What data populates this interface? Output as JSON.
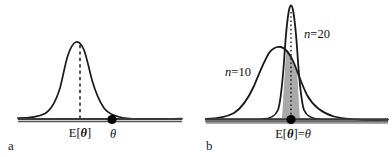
{
  "figure": {
    "background_color": "#ffffff",
    "curve_color": "#1a1a1a",
    "shade_color": "#a9a9a9",
    "axis_color": "#2b2b2b",
    "marker_color": "#000000"
  },
  "panels": [
    {
      "id": "a",
      "label": "a",
      "caption_expectation": "E[",
      "caption_theta_bold": "θ",
      "caption_close": "]",
      "caption_theta_plain": "θ",
      "expectation_label_full": "E[θ]",
      "theta_label": "θ",
      "description": "biased estimator: sampling distribution peak at E[theta] left of true theta",
      "axis": {
        "x_start": 18,
        "x_end": 182,
        "y": 120
      },
      "dashed_line_x": 80,
      "marker_x": 112,
      "marker_y": 120,
      "marker_radius": 4.6,
      "expectation_text_x": 80,
      "expectation_text_y": 137,
      "theta_text_x": 113,
      "theta_text_y": 138,
      "panel_label_x": 8,
      "panel_label_y": 150,
      "curve": {
        "peak_x": 76,
        "peak_y": 42,
        "baseline_y": 120,
        "sigma": 20,
        "skew_right": true
      }
    },
    {
      "id": "b",
      "label": "b",
      "caption_expectation": "E[",
      "caption_theta_bold": "θ",
      "caption_close": "]=",
      "caption_theta_plain": "θ",
      "expectation_label_full": "E[θ]=θ",
      "description": "unbiased estimators: two sampling distributions centered on true theta, n=10 wide and n=20 narrow",
      "axis": {
        "x_start": 205,
        "x_end": 388,
        "y": 120
      },
      "dotted_line_x": 291,
      "marker_x": 291,
      "marker_y": 120,
      "marker_radius": 4.6,
      "expectation_text_x": 293,
      "expectation_text_y": 138,
      "panel_label_x": 206,
      "panel_label_y": 150,
      "curves": [
        {
          "name": "n=10",
          "label_n": "n",
          "label_eq_value": "=10",
          "label_x": 228,
          "label_y": 76,
          "peak_x": 281,
          "peak_y": 47,
          "sigma": 28,
          "shaded": true
        },
        {
          "name": "n=20",
          "label_n": "n",
          "label_eq_value": "=20",
          "label_x": 305,
          "label_y": 38,
          "peak_x": 291,
          "peak_y": 6,
          "sigma": 9,
          "shaded": false
        }
      ],
      "shading": {
        "left_band_start": 212,
        "left_band_end": 272,
        "right_band_start": 308,
        "right_band_end": 385,
        "color": "#a9a9a9"
      }
    }
  ]
}
